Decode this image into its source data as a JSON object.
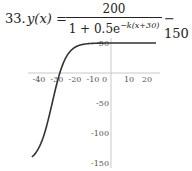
{
  "problem": {
    "number": "33.",
    "lhs": "y(x) =",
    "numerator": "200",
    "denominator_base": "1 + 0.5e",
    "denominator_exponent": "−k(x+30)",
    "rhs": "− 150"
  },
  "chart_data": {
    "type": "line",
    "xlabel": "",
    "ylabel": "",
    "x_ticks": [
      "-40",
      "-30",
      "-20",
      "-10",
      "0",
      "10",
      "20"
    ],
    "y_ticks": [
      "50",
      "-50",
      "-100",
      "-150"
    ],
    "xlim": [
      -45,
      25
    ],
    "ylim": [
      -150,
      55
    ],
    "grid": false,
    "series": [
      {
        "name": "y(x)",
        "k_estimate": 0.26,
        "x": [
          -44,
          -40,
          -35,
          -30,
          -28,
          -25,
          -20,
          -15,
          -10,
          0,
          10,
          20,
          25
        ],
        "y": [
          -140,
          -114,
          -70,
          -17,
          0,
          22,
          43,
          48.6,
          49.7,
          50,
          50,
          50,
          50
        ]
      }
    ],
    "asymptotes": {
      "upper": 50,
      "lower": -150
    }
  }
}
